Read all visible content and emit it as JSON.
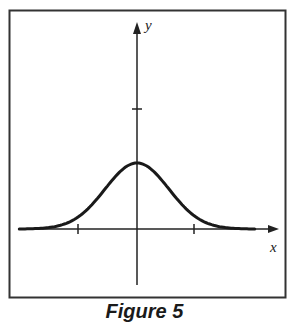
{
  "figure": {
    "caption": "Figure 5"
  },
  "chart_data": {
    "type": "line",
    "title": "",
    "xlabel": "x",
    "ylabel": "y",
    "x_ticks": [
      -1,
      1
    ],
    "y_ticks": [
      1
    ],
    "tick_labels_shown": false,
    "grid": false,
    "legend": null,
    "series": [
      {
        "name": "y = e^(-x^2/2) scaled (bell curve)",
        "x": [
          -2.3,
          -2.0,
          -1.5,
          -1.0,
          -0.5,
          0.0,
          0.5,
          1.0,
          1.5,
          2.0,
          2.3
        ],
        "y": [
          0.0,
          0.02,
          0.13,
          0.32,
          0.49,
          0.55,
          0.49,
          0.32,
          0.13,
          0.02,
          0.0
        ]
      }
    ],
    "peak": {
      "x": 0,
      "y": 0.55
    },
    "xlim": [
      -2.5,
      2.5
    ],
    "ylim": [
      -0.8,
      2.0
    ]
  },
  "colors": {
    "stroke": "#1a1a1a",
    "border": "#333333",
    "background": "#ffffff"
  }
}
